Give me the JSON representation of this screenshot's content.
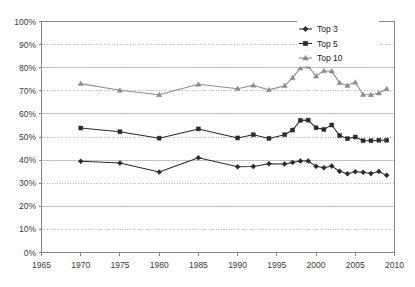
{
  "chart_data": {
    "type": "line",
    "title": "",
    "subtitle": "",
    "xlabel": "",
    "ylabel": "",
    "xlim": [
      1965,
      2010
    ],
    "ylim": [
      0,
      1.0
    ],
    "grid": true,
    "grid_style": "horizontal-dotted",
    "legend_position": "top-right",
    "x_tick_labels": [
      "1965",
      "1970",
      "1975",
      "1980",
      "1985",
      "1990",
      "1995",
      "2000",
      "2005",
      "2010"
    ],
    "x_ticks": [
      1965,
      1970,
      1975,
      1980,
      1985,
      1990,
      1995,
      2000,
      2005,
      2010
    ],
    "y_tick_labels": [
      "0%",
      "10%",
      "20%",
      "30%",
      "40%",
      "50%",
      "60%",
      "70%",
      "80%",
      "90%",
      "100%"
    ],
    "y_ticks": [
      0,
      10,
      20,
      30,
      40,
      50,
      60,
      70,
      80,
      90,
      100
    ],
    "series": [
      {
        "name": "Top 3",
        "marker": "diamond",
        "color": "#2b2b2b",
        "x": [
          1970,
          1975,
          1980,
          1985,
          1990,
          1992,
          1994,
          1996,
          1997,
          1998,
          1999,
          2000,
          2001,
          2002,
          2003,
          2004,
          2005,
          2006,
          2007,
          2008,
          2009
        ],
        "values": [
          39.5,
          38.7,
          34.8,
          41.0,
          37.1,
          37.2,
          38.4,
          38.3,
          39.0,
          39.6,
          39.6,
          37.3,
          36.7,
          37.4,
          35.2,
          34.1,
          35.0,
          34.7,
          34.2,
          35.1,
          33.4
        ]
      },
      {
        "name": "Top 5",
        "marker": "square",
        "color": "#2b2b2b",
        "x": [
          1970,
          1975,
          1980,
          1985,
          1990,
          1992,
          1994,
          1996,
          1997,
          1998,
          1999,
          2000,
          2001,
          2002,
          2003,
          2004,
          2005,
          2006,
          2007,
          2008,
          2009
        ],
        "values": [
          53.9,
          52.3,
          49.5,
          53.5,
          49.6,
          51.0,
          49.4,
          51.0,
          53.0,
          57.2,
          57.3,
          54.0,
          53.3,
          55.2,
          50.6,
          49.3,
          50.0,
          48.4,
          48.4,
          48.6,
          48.6
        ]
      },
      {
        "name": "Top 10",
        "marker": "triangle",
        "color": "#8c8c8c",
        "x": [
          1970,
          1975,
          1980,
          1985,
          1990,
          1992,
          1994,
          1996,
          1997,
          1998,
          1999,
          2000,
          2001,
          2002,
          2003,
          2004,
          2005,
          2006,
          2007,
          2008,
          2009
        ],
        "values": [
          73.1,
          70.2,
          68.3,
          72.8,
          70.9,
          72.4,
          70.4,
          72.2,
          75.6,
          79.8,
          80.6,
          76.4,
          78.6,
          78.5,
          73.4,
          72.3,
          73.7,
          68.4,
          68.3,
          69.0,
          70.8
        ]
      }
    ]
  },
  "legend": {
    "items": [
      {
        "label": "Top 3"
      },
      {
        "label": "Top 5"
      },
      {
        "label": "Top 10"
      }
    ]
  },
  "colors": {
    "dark_series": "#2b2b2b",
    "light_series": "#8c8c8c",
    "axis": "#868686",
    "grid": "#a9a9a9",
    "text": "#3a3a3a",
    "background": "#ffffff"
  }
}
